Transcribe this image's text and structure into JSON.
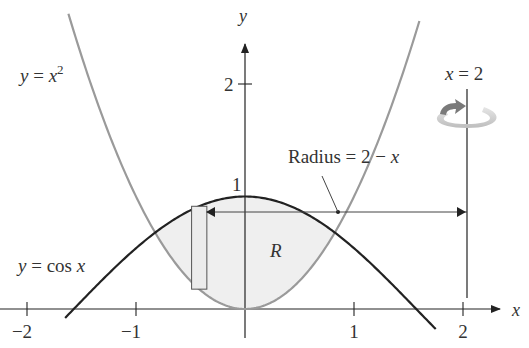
{
  "diagram": {
    "type": "region-revolution",
    "x_axis": {
      "label": "x",
      "ticks": [
        {
          "value": -2,
          "label": "−2"
        },
        {
          "value": -1,
          "label": "−1"
        },
        {
          "value": 1,
          "label": "1"
        },
        {
          "value": 2,
          "label": "2"
        }
      ],
      "range": [
        -2.2,
        2.4
      ]
    },
    "y_axis": {
      "label": "y",
      "ticks": [
        {
          "value": 1,
          "label": "1"
        },
        {
          "value": 2,
          "label": "2"
        }
      ],
      "range": [
        0,
        2.6
      ]
    },
    "curves": [
      {
        "name": "parabola",
        "equation_lhs": "y = ",
        "equation_var": "x",
        "equation_sup": "2",
        "color": "#9a9a9a",
        "domain": [
          -0.95,
          1.6
        ]
      },
      {
        "name": "cosine",
        "equation": "y = cos x",
        "equation_lhs": "y = cos ",
        "equation_var": "x",
        "color": "#222222",
        "domain": [
          -1.65,
          1.75
        ]
      }
    ],
    "region": {
      "label": "R",
      "fill": "#efefef",
      "bounded_by": [
        "y = x^2",
        "y = cos x"
      ],
      "x_bounds": [
        -0.824,
        0.824
      ]
    },
    "axis_of_rotation": {
      "label_var": "x",
      "label_rest": " = 2",
      "x": 2
    },
    "sample_rectangle": {
      "x_center": -0.42
    },
    "radius_label": {
      "text": "Radius = 2 − ",
      "var": "x"
    },
    "rotation_arrow_color": "#c8c8c8"
  }
}
